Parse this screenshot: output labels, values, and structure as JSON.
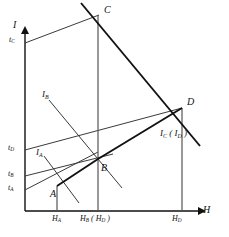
{
  "figure": {
    "background": "#ffffff",
    "line_color": "#111111",
    "width": 229,
    "height": 237
  },
  "axes": {
    "y_label": "I",
    "x_label": "H",
    "origin": {
      "x": 25,
      "y": 211
    },
    "y_top": {
      "x": 25,
      "y": 28
    },
    "x_right": {
      "x": 205,
      "y": 211
    }
  },
  "points": [
    {
      "name": "A",
      "label": "A",
      "x": 57,
      "y": 186,
      "label_x": 50,
      "label_y": 189
    },
    {
      "name": "B",
      "label": "B",
      "x": 98,
      "y": 159,
      "label_x": 101,
      "label_y": 163
    },
    {
      "name": "C",
      "label": "C",
      "x": 98,
      "y": 15,
      "label_x": 104,
      "label_y": 6
    },
    {
      "name": "D",
      "label": "D",
      "x": 182,
      "y": 108,
      "label_x": 187,
      "label_y": 98
    }
  ],
  "y_ticks": [
    {
      "name": "t_C",
      "base": "t",
      "sub": "C",
      "x": 10,
      "y": 38,
      "line_y": 43
    },
    {
      "name": "t_D",
      "base": "t",
      "sub": "D",
      "x": 9,
      "y": 146,
      "line_y": 150
    },
    {
      "name": "t_B",
      "base": "t",
      "sub": "B",
      "x": 9,
      "y": 172,
      "line_y": 176
    },
    {
      "name": "t_A",
      "base": "t",
      "sub": "A",
      "x": 9,
      "y": 186,
      "line_y": 190
    }
  ],
  "x_ticks": [
    {
      "name": "H_A",
      "text": "H",
      "sub": "A",
      "paren": "",
      "x": 52,
      "y": 216,
      "tick_x": 59
    },
    {
      "name": "H_B_H_C",
      "text": "H",
      "sub": "B",
      "paren": "( H_C )",
      "x": 80,
      "y": 216,
      "tick_x": 98
    },
    {
      "name": "H_D",
      "text": "H",
      "sub": "D",
      "paren": "",
      "x": 175,
      "y": 216,
      "tick_x": 182
    }
  ],
  "curve_labels": [
    {
      "name": "I_A",
      "base": "I",
      "sub": "A",
      "x": 36,
      "y": 151
    },
    {
      "name": "I_B",
      "base": "I",
      "sub": "B",
      "x": 42,
      "y": 93
    },
    {
      "name": "I_C_I_D",
      "base": "I",
      "sub": "C",
      "paren": "( I_D )",
      "x": 162,
      "y": 131
    }
  ],
  "lines": {
    "t_C_to_C": {
      "from": [
        25,
        43
      ],
      "to": [
        98,
        15
      ],
      "weight": "thin"
    },
    "t_D_to_D": {
      "from": [
        25,
        150
      ],
      "to": [
        182,
        108
      ],
      "weight": "thin"
    },
    "t_B_to_B": {
      "from": [
        25,
        176
      ],
      "to": [
        98,
        159
      ],
      "weight": "thin"
    },
    "t_A_to_A": {
      "from": [
        25,
        190
      ],
      "to": [
        98,
        152
      ],
      "weight": "thin"
    },
    "C_to_D_ext": {
      "from": [
        80,
        3
      ],
      "to": [
        200,
        146
      ],
      "weight": "thick"
    },
    "A_to_B_to_D": {
      "from": [
        57,
        186
      ],
      "via": [
        98,
        159
      ],
      "to": [
        182,
        108
      ],
      "weight": "thick"
    },
    "I_A_slant": {
      "from": [
        44,
        156
      ],
      "to": [
        78,
        201
      ],
      "weight": "thin"
    },
    "I_B_slant": {
      "from": [
        48,
        99
      ],
      "to": [
        120,
        186
      ],
      "weight": "thin"
    },
    "vertical_C": {
      "from": [
        98,
        15
      ],
      "to": [
        98,
        211
      ],
      "weight": "medium"
    },
    "vertical_D": {
      "from": [
        182,
        108
      ],
      "to": [
        182,
        211
      ],
      "weight": "medium"
    },
    "vertical_A": {
      "from": [
        57,
        186
      ],
      "to": [
        57,
        211
      ],
      "weight": "medium"
    }
  }
}
